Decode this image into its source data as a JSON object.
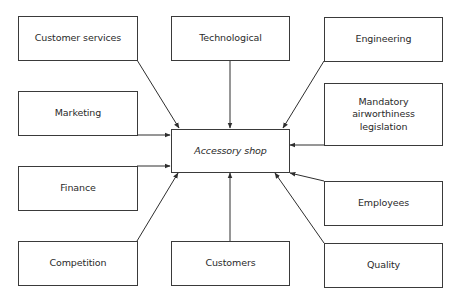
{
  "diagram": {
    "center": {
      "id": "accessory-shop",
      "label": "Accessory shop"
    },
    "nodes": [
      {
        "id": "customer-services",
        "label": "Customer services"
      },
      {
        "id": "technological",
        "label": "Technological"
      },
      {
        "id": "engineering",
        "label": "Engineering"
      },
      {
        "id": "marketing",
        "label": "Marketing"
      },
      {
        "id": "mandatory-airworthiness-legislation",
        "label": "Mandatory\nairworthiness\nlegislation",
        "lines": [
          "Mandatory",
          "airworthiness",
          "legislation"
        ]
      },
      {
        "id": "finance",
        "label": "Finance"
      },
      {
        "id": "employees",
        "label": "Employees"
      },
      {
        "id": "competition",
        "label": "Competition"
      },
      {
        "id": "customers",
        "label": "Customers"
      },
      {
        "id": "quality",
        "label": "Quality"
      }
    ],
    "edges": [
      {
        "from": "customer-services",
        "to": "accessory-shop"
      },
      {
        "from": "technological",
        "to": "accessory-shop"
      },
      {
        "from": "engineering",
        "to": "accessory-shop"
      },
      {
        "from": "marketing",
        "to": "accessory-shop"
      },
      {
        "from": "mandatory-airworthiness-legislation",
        "to": "accessory-shop"
      },
      {
        "from": "finance",
        "to": "accessory-shop"
      },
      {
        "from": "employees",
        "to": "accessory-shop"
      },
      {
        "from": "competition",
        "to": "accessory-shop"
      },
      {
        "from": "customers",
        "to": "accessory-shop"
      },
      {
        "from": "quality",
        "to": "accessory-shop"
      }
    ]
  }
}
